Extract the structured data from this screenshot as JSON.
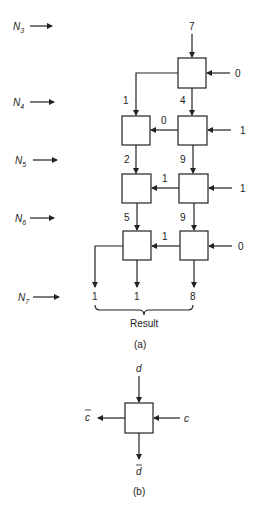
{
  "row_labels": [
    {
      "base": "N",
      "sub": "3"
    },
    {
      "base": "N",
      "sub": "4"
    },
    {
      "base": "N",
      "sub": "5"
    },
    {
      "base": "N",
      "sub": "6"
    },
    {
      "base": "N",
      "sub": "7"
    }
  ],
  "part_a": {
    "top_input": "7",
    "right_inputs": [
      "0",
      "1",
      "1",
      "0"
    ],
    "row4": {
      "left_down": "1",
      "right_down": "4",
      "carry": "0"
    },
    "row5": {
      "left_down": "2",
      "right_down": "9",
      "carry": "1"
    },
    "row6": {
      "left_down": "5",
      "right_down": "9",
      "carry": "1"
    },
    "result_digits": [
      "1",
      "1",
      "8"
    ],
    "result_label": "Result",
    "caption": "(a)"
  },
  "part_b": {
    "top": "d",
    "right": "c",
    "left": "c",
    "bottom": "d",
    "caption": "(b)"
  }
}
